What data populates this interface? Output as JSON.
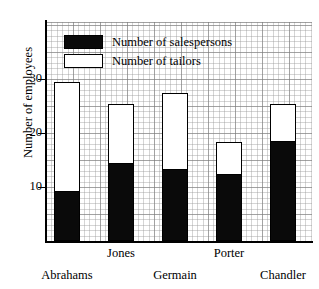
{
  "chart_data": {
    "type": "bar",
    "stacked": true,
    "title": "",
    "xlabel": "",
    "ylabel": "Number of employees",
    "categories": [
      "Abrahams",
      "Jones",
      "Germain",
      "Porter",
      "Chandler"
    ],
    "series": [
      {
        "name": "Number of salespersons",
        "color": "#0a0a0a",
        "values": [
          9,
          14,
          13,
          12,
          18
        ]
      },
      {
        "name": "Number of tailors",
        "color": "#ffffff",
        "values": [
          20,
          11,
          14,
          6,
          7
        ]
      }
    ],
    "totals": [
      29,
      25,
      27,
      18,
      25
    ],
    "ylim": [
      0,
      40
    ],
    "yticks": [
      10,
      20,
      30
    ],
    "ytick_labels": [
      "10",
      "20",
      "30"
    ],
    "grid": true,
    "legend_position": "top-left"
  },
  "axis": {
    "y_title": "Number of employees",
    "ticks": [
      {
        "label": "30",
        "value": 30
      },
      {
        "label": "20",
        "value": 20
      },
      {
        "label": "10",
        "value": 10
      }
    ]
  },
  "legend": {
    "items": [
      {
        "label": "Number of salespersons",
        "swatch": "filled"
      },
      {
        "label": "Number of tailors",
        "swatch": "hollow"
      }
    ]
  },
  "x_labels": [
    {
      "label": "Abrahams",
      "row": "lower"
    },
    {
      "label": "Jones",
      "row": "upper"
    },
    {
      "label": "Germain",
      "row": "lower"
    },
    {
      "label": "Porter",
      "row": "upper"
    },
    {
      "label": "Chandler",
      "row": "lower"
    }
  ]
}
